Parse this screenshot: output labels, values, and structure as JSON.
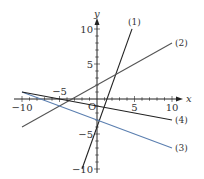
{
  "chart_data": {
    "type": "line",
    "title": "",
    "xlabel": "x",
    "ylabel": "y",
    "origin_label": "O",
    "xlim": [
      -10.5,
      10.5
    ],
    "ylim": [
      -10.5,
      10.5
    ],
    "grid": false,
    "x_ticks": [
      -10,
      -5,
      5,
      10
    ],
    "y_ticks": [
      -10,
      -5,
      5,
      10
    ],
    "x_tick_labels": [
      "−10",
      "−5",
      "5",
      "10"
    ],
    "y_tick_labels": [
      "−10",
      "−5",
      "5",
      "10"
    ],
    "series": [
      {
        "name": "(1)",
        "equation": "y = 3x − 4",
        "slope": 3,
        "intercept": -4,
        "x_range": [
          -2,
          4.67
        ],
        "color": "#222222"
      },
      {
        "name": "(2)",
        "equation": "y = (3/5)x + 2",
        "slope": 0.6,
        "intercept": 2,
        "x_range": [
          -10,
          10
        ],
        "color": "#555555"
      },
      {
        "name": "(3)",
        "equation": "y = −(2/5)x − 3",
        "slope": -0.4,
        "intercept": -3,
        "x_range": [
          -10,
          10
        ],
        "color": "#5b7fb0"
      },
      {
        "name": "(4)",
        "equation": "y = −(1/5)x − 1",
        "slope": -0.2,
        "intercept": -1,
        "x_range": [
          -10,
          10
        ],
        "color": "#222222"
      }
    ]
  }
}
